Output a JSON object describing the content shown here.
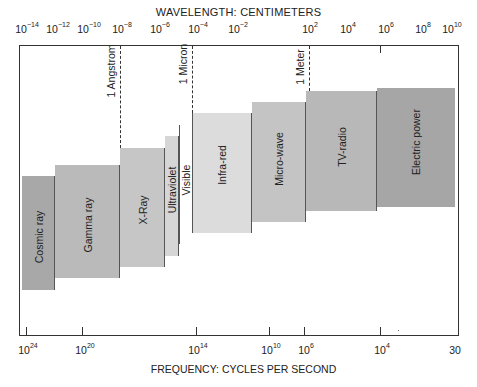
{
  "title_top": "WAVELENGTH:  CENTIMETERS",
  "title_bottom": "FREQUENCY:  CYCLES PER SECOND",
  "top_axis": [
    {
      "base": "10",
      "exp": "−14",
      "x": 27
    },
    {
      "base": "10",
      "exp": "−12",
      "x": 58
    },
    {
      "base": "10",
      "exp": "−10",
      "x": 89
    },
    {
      "base": "10",
      "exp": "−8",
      "x": 122
    },
    {
      "base": "10",
      "exp": "−6",
      "x": 160
    },
    {
      "base": "10",
      "exp": "−4",
      "x": 198
    },
    {
      "base": "10",
      "exp": "−2",
      "x": 238
    },
    {
      "base": "10",
      "exp": "2",
      "x": 310
    },
    {
      "base": "10",
      "exp": "4",
      "x": 348
    },
    {
      "base": "10",
      "exp": "6",
      "x": 386
    },
    {
      "base": "10",
      "exp": "8",
      "x": 423
    },
    {
      "base": "10",
      "exp": "10",
      "x": 452
    }
  ],
  "bottom_axis": [
    {
      "base": "10",
      "exp": "24",
      "x": 28
    },
    {
      "base": "10",
      "exp": "20",
      "x": 85
    },
    {
      "base": "10",
      "exp": "14",
      "x": 198
    },
    {
      "base": "10",
      "exp": "10",
      "x": 271
    },
    {
      "base": "10",
      "exp": "6",
      "x": 306
    },
    {
      "base": "10",
      "exp": "4",
      "x": 382
    },
    {
      "base": "30",
      "exp": "",
      "x": 455
    }
  ],
  "markers": [
    {
      "label": "1 Angstrom",
      "x": 120
    },
    {
      "label": "1 Micron",
      "x": 192
    },
    {
      "label": "1 Meter",
      "x": 309
    }
  ],
  "bands": [
    {
      "label": "Cosmic ray",
      "x0": 22,
      "x1": 55,
      "top": 176,
      "bottom": 290,
      "color": "#a8a8a8"
    },
    {
      "label": "Gamma ray",
      "x0": 55,
      "x1": 120,
      "top": 165,
      "bottom": 278,
      "color": "#bababa"
    },
    {
      "label": "X-Ray",
      "x0": 120,
      "x1": 165,
      "top": 148,
      "bottom": 267,
      "color": "#c6c6c6"
    },
    {
      "label": "Ultraviolet",
      "x0": 165,
      "x1": 179,
      "top": 136,
      "bottom": 256,
      "color": "#d6d6d6"
    },
    {
      "label": "Visible",
      "x0": 179,
      "x1": 192,
      "top": 125,
      "bottom": 244,
      "color": "#ffffff"
    },
    {
      "label": "Infra-red",
      "x0": 192,
      "x1": 252,
      "top": 113,
      "bottom": 233,
      "color": "#dcdcdc"
    },
    {
      "label": "Micro-wave",
      "x0": 252,
      "x1": 306,
      "top": 102,
      "bottom": 222,
      "color": "#c4c4c4"
    },
    {
      "label": "TV-radio",
      "x0": 306,
      "x1": 377,
      "top": 91,
      "bottom": 211,
      "color": "#b8b8b8"
    },
    {
      "label": "Electric power",
      "x0": 377,
      "x1": 455,
      "top": 88,
      "bottom": 207,
      "color": "#a6a6a6"
    }
  ]
}
